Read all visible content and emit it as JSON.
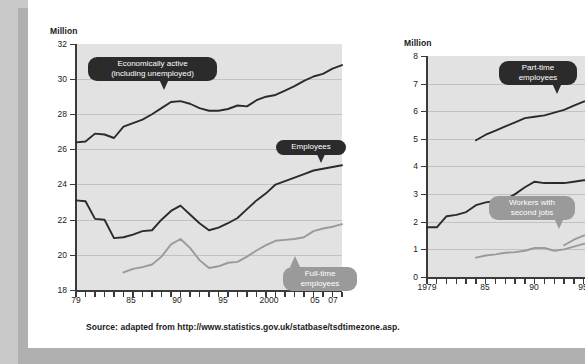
{
  "figure": {
    "background_color": "#c9c9c9",
    "card_color": "#ffffff",
    "plot_color": "#e2e2e2",
    "source_note": "Source: adapted from http://www.statistics.gov.uk/statbase/tsdtimezone.asp."
  },
  "chart_data": [
    {
      "id": "left",
      "type": "line",
      "title": "",
      "xlabel": "",
      "ylabel": "Million",
      "ylim": [
        18,
        32
      ],
      "ytick_labels": [
        "32",
        "30",
        "28",
        "26",
        "24",
        "22",
        "20",
        "18"
      ],
      "yticks": [
        32,
        30,
        28,
        26,
        24,
        22,
        20,
        18
      ],
      "xlim": [
        1979,
        2007
      ],
      "xtick_labels": [
        "79",
        "85",
        "90",
        "95",
        "2000",
        "05",
        "07"
      ],
      "xticks": [
        1979,
        1985,
        1990,
        1995,
        2000,
        2005,
        2007
      ],
      "grid": "horizontal",
      "legend": "annotations",
      "series": [
        {
          "name": "Economically active (including unemployed)",
          "color": "#2b2b2b",
          "x": [
            1979,
            1980,
            1981,
            1982,
            1983,
            1984,
            1985,
            1986,
            1987,
            1988,
            1989,
            1990,
            1991,
            1992,
            1993,
            1994,
            1995,
            1996,
            1997,
            1998,
            1999,
            2000,
            2001,
            2002,
            2003,
            2004,
            2005,
            2006,
            2007
          ],
          "values": [
            26.4,
            26.45,
            26.9,
            26.85,
            26.65,
            27.3,
            27.5,
            27.7,
            28.0,
            28.35,
            28.7,
            28.75,
            28.6,
            28.35,
            28.2,
            28.2,
            28.3,
            28.5,
            28.45,
            28.8,
            29.0,
            29.1,
            29.35,
            29.6,
            29.9,
            30.15,
            30.3,
            30.6,
            30.8
          ]
        },
        {
          "name": "Employees",
          "color": "#2b2b2b",
          "x": [
            1979,
            1980,
            1981,
            1982,
            1983,
            1984,
            1985,
            1986,
            1987,
            1988,
            1989,
            1990,
            1991,
            1992,
            1993,
            1994,
            1995,
            1996,
            1997,
            1998,
            1999,
            2000,
            2001,
            2002,
            2003,
            2004,
            2005,
            2006,
            2007
          ],
          "values": [
            23.1,
            23.05,
            22.05,
            22.0,
            20.95,
            21.0,
            21.15,
            21.35,
            21.4,
            22.0,
            22.5,
            22.8,
            22.3,
            21.8,
            21.4,
            21.55,
            21.8,
            22.1,
            22.6,
            23.1,
            23.5,
            24.0,
            24.2,
            24.4,
            24.6,
            24.8,
            24.9,
            25.0,
            25.1
          ]
        },
        {
          "name": "Full-time employees",
          "color": "#9a9a9a",
          "x": [
            1984,
            1985,
            1986,
            1987,
            1988,
            1989,
            1990,
            1991,
            1992,
            1993,
            1994,
            1995,
            1996,
            1997,
            1998,
            1999,
            2000,
            2001,
            2002,
            2003,
            2004,
            2005,
            2006,
            2007
          ],
          "values": [
            19.0,
            19.2,
            19.3,
            19.45,
            19.9,
            20.6,
            20.9,
            20.4,
            19.7,
            19.25,
            19.35,
            19.55,
            19.6,
            19.9,
            20.25,
            20.55,
            20.8,
            20.85,
            20.9,
            21.0,
            21.35,
            21.5,
            21.6,
            21.75
          ]
        }
      ],
      "annotations": [
        {
          "text": "Economically active\n(including unemployed)",
          "style": "dark"
        },
        {
          "text": "Employees",
          "style": "dark"
        },
        {
          "text": "Full-time\nemployees",
          "style": "grey"
        }
      ]
    },
    {
      "id": "right",
      "type": "line",
      "title": "",
      "xlabel": "",
      "ylabel": "Million",
      "ylim": [
        0,
        8
      ],
      "ytick_labels": [
        "8",
        "7",
        "6",
        "5",
        "4",
        "3",
        "2",
        "1",
        "0"
      ],
      "yticks": [
        8,
        7,
        6,
        5,
        4,
        3,
        2,
        1,
        0
      ],
      "xlim": [
        1979,
        1998
      ],
      "xtick_labels": [
        "1979",
        "85",
        "90",
        "95"
      ],
      "xticks": [
        1979,
        1985,
        1990,
        1995
      ],
      "grid": "horizontal",
      "legend": "annotations",
      "series": [
        {
          "name": "Part-time employees",
          "color": "#2b2b2b",
          "x": [
            1984,
            1985,
            1986,
            1987,
            1988,
            1989,
            1990,
            1991,
            1992,
            1993,
            1994,
            1995,
            1996,
            1997
          ],
          "values": [
            4.95,
            5.15,
            5.3,
            5.45,
            5.6,
            5.75,
            5.8,
            5.85,
            5.95,
            6.05,
            6.2,
            6.35,
            6.45,
            6.6
          ]
        },
        {
          "name": "Full-time unnamed upper",
          "color": "#2b2b2b",
          "x": [
            1979,
            1980,
            1981,
            1982,
            1983,
            1984,
            1985,
            1986,
            1987,
            1988,
            1989,
            1990,
            1991,
            1992,
            1993,
            1994,
            1995,
            1996,
            1997
          ],
          "values": [
            1.8,
            1.8,
            2.2,
            2.25,
            2.35,
            2.6,
            2.7,
            2.75,
            2.8,
            3.0,
            3.25,
            3.45,
            3.4,
            3.4,
            3.4,
            3.45,
            3.5,
            3.5,
            3.55
          ]
        },
        {
          "name": "Workers with second jobs",
          "color": "#9a9a9a",
          "x": [
            1984,
            1985,
            1986,
            1987,
            1988,
            1989,
            1990,
            1991,
            1992,
            1993,
            1994,
            1995,
            1996,
            1997
          ],
          "values": [
            0.7,
            0.78,
            0.82,
            0.88,
            0.9,
            0.95,
            1.05,
            1.05,
            0.95,
            1.0,
            1.1,
            1.2,
            1.25,
            1.3
          ]
        },
        {
          "name": "Secondary grey rising",
          "color": "#9a9a9a",
          "x": [
            1993,
            1994,
            1995,
            1996,
            1997
          ],
          "values": [
            1.15,
            1.35,
            1.5,
            1.6,
            1.65
          ]
        }
      ],
      "annotations": [
        {
          "text": "Part-time\nemployees",
          "style": "dark"
        },
        {
          "text": "Workers with\nsecond jobs",
          "style": "grey"
        }
      ]
    }
  ]
}
